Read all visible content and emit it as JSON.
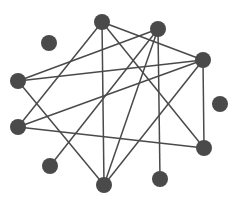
{
  "diagram": {
    "type": "network-graph",
    "colors": {
      "node": "#4a4a4a",
      "edge": "#4a4a4a",
      "background": "#ffffff"
    },
    "nodes": [
      {
        "id": "n1"
      },
      {
        "id": "n2"
      },
      {
        "id": "n3"
      },
      {
        "id": "n4"
      },
      {
        "id": "n5"
      },
      {
        "id": "n6"
      },
      {
        "id": "n7"
      },
      {
        "id": "n8"
      },
      {
        "id": "n9"
      },
      {
        "id": "n10"
      },
      {
        "id": "n11"
      }
    ],
    "edges": [
      [
        "n1",
        "n7"
      ],
      [
        "n1",
        "n11"
      ],
      [
        "n1",
        "n8"
      ],
      [
        "n1",
        "n4"
      ],
      [
        "n2",
        "n5"
      ],
      [
        "n2",
        "n9"
      ],
      [
        "n2",
        "n11"
      ],
      [
        "n2",
        "n10"
      ],
      [
        "n4",
        "n5"
      ],
      [
        "n4",
        "n7"
      ],
      [
        "n4",
        "n11"
      ],
      [
        "n4",
        "n8"
      ],
      [
        "n5",
        "n11"
      ],
      [
        "n7",
        "n8"
      ]
    ]
  }
}
